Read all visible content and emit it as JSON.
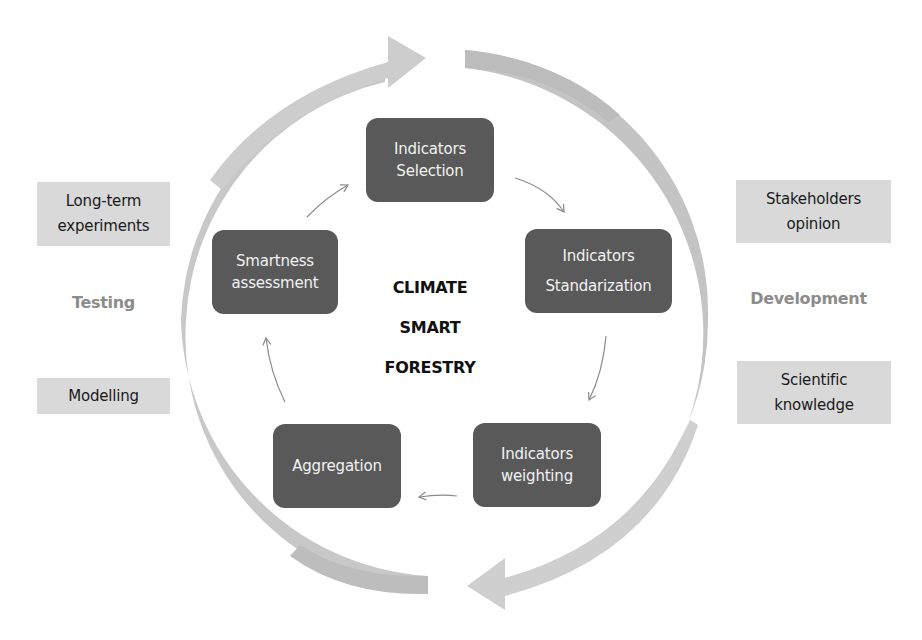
{
  "center_title": {
    "lines": [
      "CLIMATE",
      "SMART",
      "FORESTRY"
    ]
  },
  "cycle_steps": [
    {
      "id": "selection",
      "lines": [
        "Indicators",
        "Selection"
      ]
    },
    {
      "id": "standardization",
      "lines": [
        "Indicators",
        "Standarization"
      ]
    },
    {
      "id": "weighting",
      "lines": [
        "Indicators",
        "weighting"
      ]
    },
    {
      "id": "aggregation",
      "lines": [
        "Aggregation"
      ]
    },
    {
      "id": "smartness",
      "lines": [
        "Smartness",
        "assessment"
      ]
    }
  ],
  "phases": {
    "left": {
      "label": "Testing",
      "sources": [
        {
          "lines": [
            "Long-term",
            "experiments"
          ]
        },
        {
          "lines": [
            "Modelling"
          ]
        }
      ]
    },
    "right": {
      "label": "Development",
      "sources": [
        {
          "lines": [
            "Stakeholders",
            "opinion"
          ]
        },
        {
          "lines": [
            "Scientific",
            "knowledge"
          ]
        }
      ]
    }
  },
  "colors": {
    "node_fill": "#595959",
    "node_text": "#f2f2f2",
    "side_box_fill": "#d9d9d9",
    "phase_label": "#8c8c8c",
    "big_arrow": "#c8c8c8",
    "small_arrow": "#8a8a8a"
  }
}
